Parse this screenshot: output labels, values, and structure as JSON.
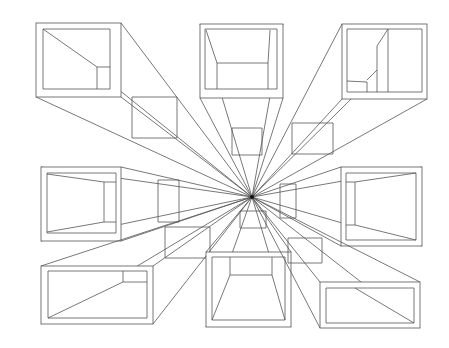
{
  "drawing": {
    "title": "One-point perspective boxes",
    "stroke_color": "#555555",
    "background": "#ffffff",
    "vanishing_point": [
      252,
      197
    ],
    "boxes": [
      {
        "name": "box-top-left",
        "outer": [
          36,
          23,
          121,
          97
        ],
        "inner": [
          43,
          29,
          110,
          89
        ],
        "back": [
          132,
          97,
          177,
          138
        ],
        "detail": [
          [
            43,
            29,
            97,
            67
          ],
          [
            97,
            67,
            97,
            89
          ],
          [
            97,
            67,
            110,
            67
          ]
        ]
      },
      {
        "name": "box-top-center",
        "outer": [
          200,
          24,
          283,
          98
        ],
        "inner": [
          205,
          29,
          277,
          89
        ],
        "back": [
          232,
          128,
          262,
          155
        ],
        "detail": [
          [
            206,
            30,
            217,
            63
          ],
          [
            270,
            30,
            268,
            63
          ],
          [
            217,
            63,
            268,
            63
          ],
          [
            217,
            63,
            217,
            89
          ],
          [
            268,
            63,
            268,
            89
          ]
        ]
      },
      {
        "name": "box-top-right",
        "outer": [
          342,
          24,
          427,
          99
        ],
        "inner": [
          347,
          29,
          422,
          92
        ],
        "back": [
          292,
          123,
          333,
          154
        ],
        "detail": [
          [
            388,
            29,
            388,
            92
          ],
          [
            388,
            29,
            377,
            46
          ],
          [
            377,
            46,
            377,
            92
          ],
          [
            377,
            70,
            367,
            80
          ],
          [
            347,
            81,
            367,
            82
          ],
          [
            367,
            82,
            367,
            92
          ]
        ]
      },
      {
        "name": "box-middle-left",
        "outer": [
          41,
          167,
          121,
          241
        ],
        "inner": [
          47,
          173,
          116,
          233
        ],
        "back": [
          158,
          180,
          179,
          222
        ],
        "detail": [
          [
            47,
            174,
            104,
            182
          ],
          [
            104,
            182,
            104,
            222
          ],
          [
            47,
            232,
            104,
            222
          ],
          [
            104,
            182,
            116,
            182
          ],
          [
            104,
            222,
            116,
            222
          ]
        ]
      },
      {
        "name": "box-middle-right",
        "outer": [
          341,
          167,
          422,
          246
        ],
        "inner": [
          346,
          173,
          416,
          240
        ],
        "back": [
          280,
          184,
          296,
          218
        ],
        "detail": [
          [
            355,
            182,
            416,
            173
          ],
          [
            355,
            182,
            355,
            225
          ],
          [
            355,
            225,
            416,
            240
          ],
          [
            346,
            182,
            355,
            182
          ],
          [
            346,
            225,
            355,
            225
          ]
        ]
      },
      {
        "name": "box-bottom-left",
        "outer": [
          41,
          266,
          153,
          324
        ],
        "inner": [
          48,
          271,
          147,
          318
        ],
        "back": [
          165,
          227,
          210,
          258
        ],
        "detail": [
          [
            123,
            271,
            123,
            282
          ],
          [
            123,
            282,
            147,
            282
          ],
          [
            48,
            318,
            123,
            282
          ]
        ]
      },
      {
        "name": "box-bottom-center",
        "outer": [
          206,
          252,
          291,
          327
        ],
        "inner": [
          212,
          257,
          285,
          320
        ],
        "back": [
          240,
          211,
          266,
          228
        ],
        "detail": [
          [
            230,
            257,
            230,
            275
          ],
          [
            272,
            257,
            272,
            275
          ],
          [
            230,
            275,
            272,
            275
          ],
          [
            230,
            275,
            212,
            320
          ],
          [
            272,
            275,
            285,
            320
          ]
        ]
      },
      {
        "name": "box-bottom-right",
        "outer": [
          320,
          282,
          420,
          328
        ],
        "inner": [
          326,
          288,
          414,
          323
        ],
        "back": [
          288,
          238,
          322,
          263
        ],
        "detail": [
          [
            355,
            288,
            414,
            323
          ]
        ]
      }
    ]
  }
}
